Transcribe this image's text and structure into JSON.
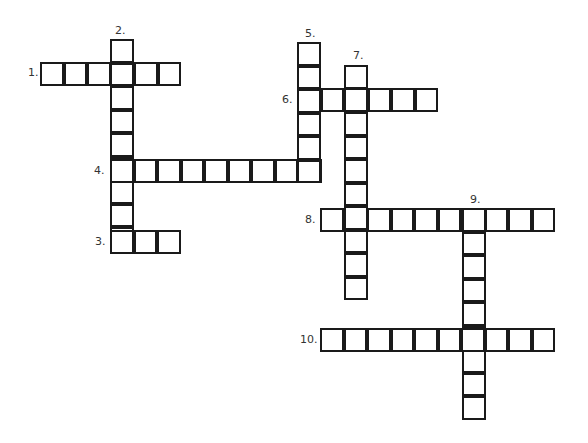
{
  "puzzle": {
    "type": "crossword",
    "cell_size": 23.5,
    "colors": {
      "line": "#1a1a1a",
      "background": "#ffffff",
      "number": "#333333"
    },
    "entries": [
      {
        "number": "1.",
        "direction": "across",
        "length": 6,
        "x": 40,
        "y": 62,
        "label_x": 28,
        "label_y": 67
      },
      {
        "number": "2.",
        "direction": "down",
        "length": 9,
        "x": 110,
        "y": 39,
        "label_x": 115,
        "label_y": 25
      },
      {
        "number": "3.",
        "direction": "across",
        "length": 3,
        "x": 110,
        "y": 230,
        "label_x": 95,
        "label_y": 236
      },
      {
        "number": "4.",
        "direction": "across",
        "length": 9,
        "x": 110,
        "y": 159,
        "label_x": 94,
        "label_y": 165
      },
      {
        "number": "5.",
        "direction": "down",
        "length": 6,
        "x": 297,
        "y": 42,
        "label_x": 305,
        "label_y": 28
      },
      {
        "number": "6.",
        "direction": "across",
        "length": 6,
        "x": 297,
        "y": 88,
        "label_x": 282,
        "label_y": 94
      },
      {
        "number": "7.",
        "direction": "down",
        "length": 10,
        "x": 344,
        "y": 65,
        "label_x": 353,
        "label_y": 50
      },
      {
        "number": "8.",
        "direction": "across",
        "length": 10,
        "x": 320,
        "y": 208,
        "label_x": 305,
        "label_y": 214
      },
      {
        "number": "9.",
        "direction": "down",
        "length": 9,
        "x": 462,
        "y": 208,
        "label_x": 470,
        "label_y": 194
      },
      {
        "number": "10.",
        "direction": "across",
        "length": 10,
        "x": 320,
        "y": 328,
        "label_x": 300,
        "label_y": 334
      }
    ]
  }
}
